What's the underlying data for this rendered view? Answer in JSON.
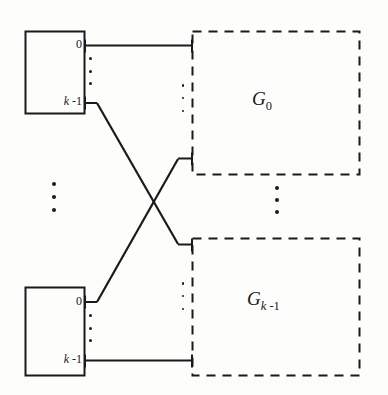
{
  "diagram": {
    "type": "interconnection-network",
    "colors": {
      "line": "#1a1a1a",
      "background": "#fdfdfc",
      "text": "#1a1a1a"
    },
    "source_modules": [
      {
        "id": "module-top",
        "ports": [
          {
            "id": "port-top-0",
            "label": "0"
          },
          {
            "id": "port-top-last",
            "label_italic": "k",
            "label_rest": " -1"
          }
        ],
        "ellipsis": "vertical-dots"
      },
      {
        "id": "module-bottom",
        "ports": [
          {
            "id": "port-bottom-0",
            "label": "0"
          },
          {
            "id": "port-bottom-last",
            "label_italic": "k",
            "label_rest": " -1"
          }
        ],
        "ellipsis": "vertical-dots"
      }
    ],
    "groups": [
      {
        "id": "group-0",
        "name_italic": "G",
        "subscript": "0"
      },
      {
        "id": "group-last",
        "name_italic": "G",
        "sub_italic": "k",
        "sub_rest": " -1"
      }
    ],
    "labels": {
      "top_port_first": "0",
      "top_port_last_var": "k",
      "top_port_last_rest": " -1",
      "bottom_port_first": "0",
      "bottom_port_last_var": "k",
      "bottom_port_last_rest": " -1",
      "group_first_name": "G",
      "group_first_sub": "0",
      "group_last_name": "G",
      "group_last_sub_var": "k",
      "group_last_sub_rest": " -1"
    },
    "ellipses": [
      {
        "id": "ellipsis-modules",
        "orientation": "vertical",
        "count": 3
      },
      {
        "id": "ellipsis-groups",
        "orientation": "vertical",
        "count": 3
      },
      {
        "id": "ellipsis-top-module-ports",
        "orientation": "vertical",
        "count": 3
      },
      {
        "id": "ellipsis-bottom-module-ports",
        "orientation": "vertical",
        "count": 3
      },
      {
        "id": "ellipsis-top-group-links",
        "orientation": "vertical",
        "count": 3
      },
      {
        "id": "ellipsis-bottom-group-links",
        "orientation": "vertical",
        "count": 3
      }
    ]
  }
}
